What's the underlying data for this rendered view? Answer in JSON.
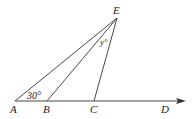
{
  "diagram": {
    "points": {
      "A": {
        "label": "A",
        "x": 15,
        "y": 101
      },
      "B": {
        "label": "B",
        "x": 47,
        "y": 101
      },
      "C": {
        "label": "C",
        "x": 94,
        "y": 101
      },
      "D": {
        "label": "D",
        "x": 165,
        "y": 101
      },
      "E": {
        "label": "E",
        "x": 117,
        "y": 18
      }
    },
    "angles": {
      "angle_A": "30°",
      "angle_E": "y°"
    },
    "colors": {
      "stroke": "#333333",
      "text": "#222222"
    }
  }
}
